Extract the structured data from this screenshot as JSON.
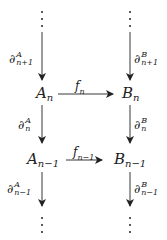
{
  "diagram": {
    "type": "commutative-diagram",
    "nodes": [
      {
        "id": "top-left-dots",
        "label": "⋮"
      },
      {
        "id": "top-right-dots",
        "label": "⋮"
      },
      {
        "id": "A_n",
        "base": "A",
        "sub": "n"
      },
      {
        "id": "B_n",
        "base": "B",
        "sub": "n"
      },
      {
        "id": "A_n-1",
        "base": "A",
        "sub": "n−1"
      },
      {
        "id": "B_n-1",
        "base": "B",
        "sub": "n−1"
      },
      {
        "id": "bottom-left-dots",
        "label": "⋮"
      },
      {
        "id": "bottom-right-dots",
        "label": "⋮"
      }
    ],
    "edges": [
      {
        "from": "top-left-dots",
        "to": "A_n",
        "sym": "∂",
        "sup": "A",
        "sub": "n+1"
      },
      {
        "from": "top-right-dots",
        "to": "B_n",
        "sym": "∂",
        "sup": "B",
        "sub": "n+1"
      },
      {
        "from": "A_n",
        "to": "B_n",
        "sym": "f",
        "sub": "n"
      },
      {
        "from": "A_n",
        "to": "A_n-1",
        "sym": "∂",
        "sup": "A",
        "sub": "n"
      },
      {
        "from": "B_n",
        "to": "B_n-1",
        "sym": "∂",
        "sup": "B",
        "sub": "n"
      },
      {
        "from": "A_n-1",
        "to": "B_n-1",
        "sym": "f",
        "sub": "n−1"
      },
      {
        "from": "A_n-1",
        "to": "bottom-left-dots",
        "sym": "∂",
        "sup": "A",
        "sub": "n−1"
      },
      {
        "from": "B_n-1",
        "to": "bottom-right-dots",
        "sym": "∂",
        "sup": "B",
        "sub": "n−1"
      }
    ]
  },
  "colors": {
    "ink": "#222222",
    "background": "#ffffff"
  }
}
